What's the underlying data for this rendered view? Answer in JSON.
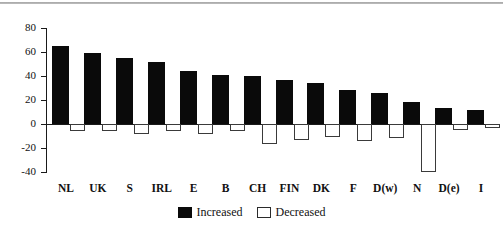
{
  "chart_data": {
    "type": "bar",
    "title": "",
    "subtitle": "",
    "xlabel": "",
    "ylabel": "",
    "ylim": [
      -40,
      80
    ],
    "yticks": [
      80,
      60,
      40,
      20,
      0,
      -20,
      -40
    ],
    "ytick_labels": [
      "80",
      "60",
      "40",
      "20",
      "0",
      "-20",
      "-40"
    ],
    "grid": false,
    "legend_position": "bottom-center",
    "categories": [
      "NL",
      "UK",
      "S",
      "IRL",
      "E",
      "B",
      "CH",
      "FIN",
      "DK",
      "F",
      "D(w)",
      "N",
      "D(e)",
      "I"
    ],
    "series": [
      {
        "name": "Increased",
        "color": "#0a0a0a",
        "style": "filled",
        "values": [
          65,
          59,
          55,
          52,
          44,
          41,
          40,
          37,
          34,
          28,
          26,
          18,
          13,
          12
        ]
      },
      {
        "name": "Decreased",
        "color": "#ffffff",
        "style": "open",
        "values": [
          -6,
          -6,
          -8,
          -6,
          -8,
          -6,
          -17,
          -13,
          -11,
          -14,
          -12,
          -40,
          -5,
          -3
        ]
      }
    ],
    "annotations": []
  },
  "legend": {
    "items": [
      {
        "label": "Increased",
        "swatch": "filled-square"
      },
      {
        "label": "Decreased",
        "swatch": "open-square"
      }
    ]
  },
  "axes": {
    "y_tick_labels": [
      "80",
      "60",
      "40",
      "20",
      "0",
      "-20",
      "-40"
    ],
    "x_tick_labels": [
      "NL",
      "UK",
      "S",
      "IRL",
      "E",
      "B",
      "CH",
      "FIN",
      "DK",
      "F",
      "D(w)",
      "N",
      "D(e)",
      "I"
    ]
  }
}
